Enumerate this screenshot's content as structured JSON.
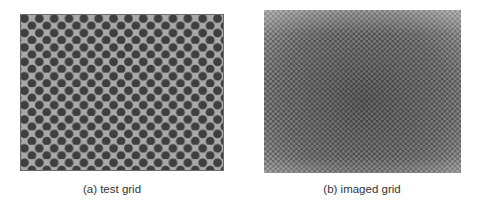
{
  "figure": {
    "panels": [
      {
        "id": "a",
        "caption": "(a) test grid",
        "description": "Synthetic hexagonal test grid of dark circular dots on gray background",
        "colors": {
          "background": "#a9a9a9",
          "dot": "#3f3f3f",
          "border": "#6a6a6a"
        },
        "pattern": {
          "pitch_x": 15,
          "pitch_y": 14.6,
          "dot_radius": 4.4
        }
      },
      {
        "id": "b",
        "caption": "(b) imaged grid",
        "description": "Camera image of the hexagonal grid with vignetting and slight distortion",
        "colors": {
          "background": "#555555",
          "hole": "#8e8e8e",
          "edge": "#9a9a9a"
        },
        "pattern": {
          "pitch_x": 5.2,
          "pitch_y": 5.0,
          "hole_radius": 1.5
        }
      }
    ]
  }
}
